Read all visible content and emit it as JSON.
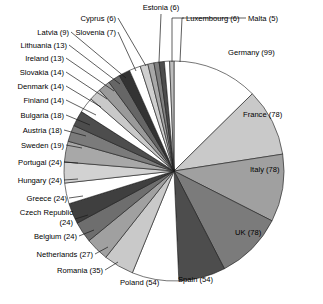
{
  "chart_data": {
    "type": "pie",
    "title": "",
    "subtitle": "",
    "xlabel": "",
    "ylabel": "",
    "legend_position": "none",
    "grid": false,
    "total": 751,
    "value_format": "name (value)",
    "start_angle_deg": 0,
    "direction": "clockwise",
    "categories": [
      "Germany",
      "France",
      "Italy",
      "UK",
      "Spain",
      "Poland",
      "Romania",
      "Netherlands",
      "Belgium",
      "Czech Republic",
      "Greece",
      "Hungary",
      "Portugal",
      "Sweden",
      "Austria",
      "Bulgaria",
      "Finland",
      "Denmark",
      "Slovakia",
      "Ireland",
      "Lithuania",
      "Latvia",
      "Slovenia",
      "Cyprus",
      "Estonia",
      "Luxembourg",
      "Malta"
    ],
    "values": [
      99,
      78,
      78,
      78,
      54,
      54,
      35,
      27,
      24,
      24,
      24,
      24,
      24,
      19,
      18,
      18,
      14,
      14,
      14,
      13,
      13,
      9,
      7,
      6,
      6,
      6,
      5
    ],
    "slice_colors": [
      "#ffffff",
      "#c9c9c9",
      "#a0a0a0",
      "#7b7b7b",
      "#4d4d4d",
      "#ffffff",
      "#c9c9c9",
      "#a0a0a0",
      "#6e6e6e",
      "#3f3f3f",
      "#ffffff",
      "#d2d2d2",
      "#a8a8a8",
      "#7b7b7b",
      "#4d4d4d",
      "#ffffff",
      "#c9c9c9",
      "#9a9a9a",
      "#666666",
      "#333333",
      "#ffffff",
      "#cfcfcf",
      "#a8a8a8",
      "#808080",
      "#4d4d4d",
      "#ffffff",
      "#bdbdbd"
    ],
    "labels": [
      {
        "text": "Germany (99)",
        "name": "Germany",
        "value": 99
      },
      {
        "text": "France (78)",
        "name": "France",
        "value": 78
      },
      {
        "text": "Italy (78)",
        "name": "Italy",
        "value": 78
      },
      {
        "text": "UK (78)",
        "name": "UK",
        "value": 78
      },
      {
        "text": "Spain (54)",
        "name": "Spain",
        "value": 54
      },
      {
        "text": "Poland (54)",
        "name": "Poland",
        "value": 54
      },
      {
        "text": "Romania (35)",
        "name": "Romania",
        "value": 35
      },
      {
        "text": "Netherlands (27)",
        "name": "Netherlands",
        "value": 27
      },
      {
        "text": "Belgium (24)",
        "name": "Belgium",
        "value": 24
      },
      {
        "text": "Czech Republic",
        "name": "Czech Republic",
        "value": 24
      },
      {
        "text": "(24)",
        "name": "Czech Republic value line",
        "value": 24
      },
      {
        "text": "Greece (24)",
        "name": "Greece",
        "value": 24
      },
      {
        "text": "Hungary (24)",
        "name": "Hungary",
        "value": 24
      },
      {
        "text": "Portugal (24)",
        "name": "Portugal",
        "value": 24
      },
      {
        "text": "Sweden (19)",
        "name": "Sweden",
        "value": 19
      },
      {
        "text": "Austria (18)",
        "name": "Austria",
        "value": 18
      },
      {
        "text": "Bulgaria (18)",
        "name": "Bulgaria",
        "value": 18
      },
      {
        "text": "Finland (14)",
        "name": "Finland",
        "value": 14
      },
      {
        "text": "Denmark (14)",
        "name": "Denmark",
        "value": 14
      },
      {
        "text": "Slovakia (14)",
        "name": "Slovakia",
        "value": 14
      },
      {
        "text": "Ireland (13)",
        "name": "Ireland",
        "value": 13
      },
      {
        "text": "Lithuania (13)",
        "name": "Lithuania",
        "value": 13
      },
      {
        "text": "Latvia (9)",
        "name": "Latvia",
        "value": 9
      },
      {
        "text": "Slovenia (7)",
        "name": "Slovenia",
        "value": 7
      },
      {
        "text": "Cyprus (6)",
        "name": "Cyprus",
        "value": 6
      },
      {
        "text": "Estonia (6)",
        "name": "Estonia",
        "value": 6
      },
      {
        "text": "Luxembourg (6)",
        "name": "Luxembourg",
        "value": 6
      },
      {
        "text": "Malta (5)",
        "name": "Malta",
        "value": 5
      }
    ]
  },
  "geometry": {
    "center_x": 174,
    "center_y": 171,
    "radius": 110
  }
}
